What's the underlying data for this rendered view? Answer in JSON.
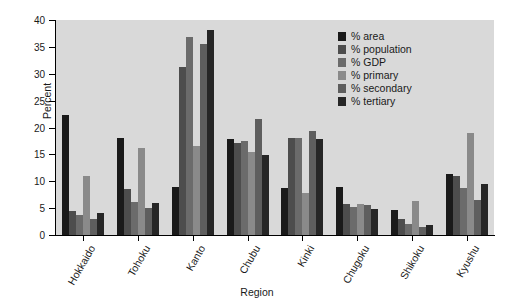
{
  "chart_data": {
    "type": "bar",
    "title": "",
    "xlabel": "Region",
    "ylabel": "Percent",
    "ylim": [
      0,
      40
    ],
    "yticks": [
      0,
      5,
      10,
      15,
      20,
      25,
      30,
      35,
      40
    ],
    "grid": false,
    "legend_position": "top-right",
    "categories": [
      "Hokkaido",
      "Tohoku",
      "Kanto",
      "Chubu",
      "Kinki",
      "Chugoku",
      "Shikoku",
      "Kyushu"
    ],
    "series": [
      {
        "name": "% area",
        "color": "#1a1a1a",
        "values": [
          22.3,
          18.0,
          8.9,
          17.9,
          8.8,
          8.9,
          4.6,
          11.4
        ]
      },
      {
        "name": "% population",
        "color": "#4d4d4d",
        "values": [
          4.5,
          8.5,
          31.2,
          17.2,
          18.0,
          5.7,
          3.0,
          11.0
        ]
      },
      {
        "name": "% GDP",
        "color": "#6b6b6b",
        "values": [
          3.7,
          6.2,
          36.8,
          17.4,
          18.0,
          5.3,
          2.1,
          8.8
        ]
      },
      {
        "name": "% primary",
        "color": "#8a8a8a",
        "values": [
          11.0,
          16.2,
          16.5,
          15.5,
          7.9,
          5.7,
          6.3,
          19.0
        ]
      },
      {
        "name": "% secondary",
        "color": "#5e5e5e",
        "values": [
          2.9,
          5.1,
          35.6,
          21.5,
          19.3,
          5.5,
          1.5,
          6.6
        ]
      },
      {
        "name": "% tertiary",
        "color": "#262626",
        "values": [
          4.1,
          6.0,
          38.2,
          14.8,
          17.9,
          4.9,
          1.8,
          9.5
        ]
      }
    ]
  },
  "legend": {
    "items": [
      {
        "label": "% area"
      },
      {
        "label": "% population"
      },
      {
        "label": "% GDP"
      },
      {
        "label": "% primary"
      },
      {
        "label": "% secondary"
      },
      {
        "label": "% tertiary"
      }
    ]
  },
  "axes": {
    "y_label": "Percent",
    "x_label": "Region",
    "y_tick_labels": [
      "0",
      "5",
      "10",
      "15",
      "20",
      "25",
      "30",
      "35",
      "40"
    ],
    "x_tick_labels": [
      "Hokkaido",
      "Tohoku",
      "Kanto",
      "Chubu",
      "Kinki",
      "Chugoku",
      "Shikoku",
      "Kyushu"
    ]
  },
  "colors": {
    "plot_background": "#d9d9d9",
    "figure_background": "#ffffff",
    "axis": "#000000",
    "text": "#1a1a1a"
  }
}
